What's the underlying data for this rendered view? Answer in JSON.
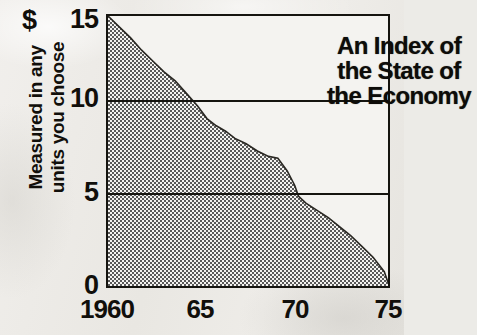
{
  "chart_data": {
    "type": "area",
    "title": "An Index of the State of the Economy",
    "title_lines": [
      "An Index of",
      "the State of",
      "the Economy"
    ],
    "xlabel": "",
    "ylabel": "Measured in any units you choose",
    "ylabel_lines": [
      "Measured in any",
      "units you choose"
    ],
    "y_unit_symbol": "$",
    "xlim": [
      1960,
      1975
    ],
    "ylim": [
      0,
      15
    ],
    "yticks": [
      0,
      5,
      10,
      15
    ],
    "ytick_labels": [
      "0",
      "5",
      "10",
      "15"
    ],
    "xticks": [
      1960,
      1965,
      1970,
      1975
    ],
    "xtick_labels": [
      "1960",
      "65",
      "70",
      "75"
    ],
    "gridlines": [
      5,
      10
    ],
    "grid": true,
    "legend": "none",
    "fill_pattern": "checkerboard-dither",
    "fill_color": "#9a9a9a",
    "line_color": "#15140f",
    "series": [
      {
        "name": "Index of the State of the Economy",
        "x": [
          1960.0,
          1960.6,
          1961.2,
          1961.8,
          1962.4,
          1963.0,
          1963.6,
          1964.2,
          1964.8,
          1965.3,
          1965.8,
          1966.3,
          1966.8,
          1967.4,
          1968.0,
          1968.6,
          1969.1,
          1969.6,
          1970.0,
          1970.2,
          1970.6,
          1971.2,
          1971.8,
          1972.4,
          1973.0,
          1973.6,
          1974.2,
          1974.8,
          1975.0
        ],
        "values": [
          15.0,
          14.4,
          13.8,
          13.1,
          12.5,
          11.9,
          11.4,
          10.7,
          10.0,
          9.3,
          8.9,
          8.6,
          8.2,
          7.9,
          7.5,
          7.2,
          7.1,
          6.4,
          5.6,
          5.0,
          4.6,
          4.2,
          3.8,
          3.3,
          2.8,
          2.2,
          1.6,
          0.8,
          0.2
        ]
      }
    ]
  },
  "axis": {
    "dollar_symbol": "$",
    "y_labels": {
      "t15": "15",
      "t10": "10",
      "t5": "5",
      "t0": "0"
    },
    "x_labels": {
      "x1960": "1960",
      "x65": "65",
      "x70": "70",
      "x75": "75"
    },
    "y_title_line1": "Measured in any",
    "y_title_line2": "units you choose"
  },
  "title": {
    "line1": "An Index of",
    "line2": "the State of",
    "line3": "the Economy"
  }
}
